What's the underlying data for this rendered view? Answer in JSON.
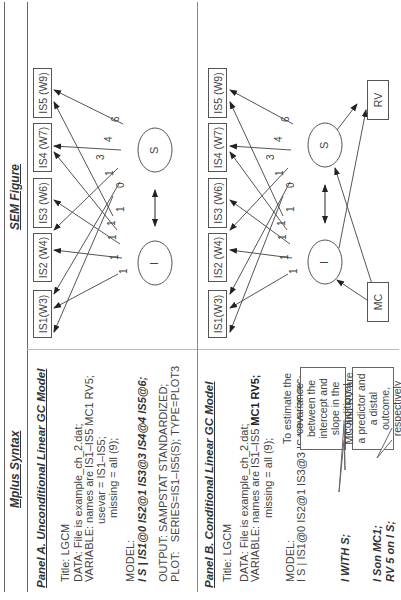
{
  "header": {
    "left_title": "Mplus Syntax",
    "right_title": "SEM Figure"
  },
  "panel_a": {
    "title": "Panel A. Unconditional Linear GC Model",
    "lines": {
      "title": "Title: LGCM",
      "data": "DATA: File is example_ch_2.dat;",
      "variable": "VARIABLE: names are IS1–IS5 MC1 RV5;",
      "usevar": "usevar = IS1–IS5;",
      "missing": "missing = all (9);",
      "model_label": "MODEL:",
      "model": "I S | IS1@0 IS2@1 IS3@3 IS4@4 IS5@6;",
      "output": "OUTPUT: SAMPSTAT STANDARDIZED;",
      "plot": "PLOT:   SERIES=IS1–IS5(S); TYPE=PLOT3"
    },
    "figure": {
      "boxes": [
        "IS1(W3)",
        "IS2 (W4)",
        "IS3 (W6)",
        "IS4 (W7)",
        "IS5 (W9)"
      ],
      "latent": [
        "I",
        "S"
      ],
      "intercept_loadings": [
        "1",
        "1",
        "1",
        "1",
        "1"
      ],
      "slope_loadings": [
        "0",
        "1",
        "3",
        "4",
        "6"
      ]
    }
  },
  "panel_b": {
    "title": "Panel B. Conditional Linear GC Model",
    "lines": {
      "title": "Title: LGCM",
      "data": "DATA: File is example_ch_2.dat;",
      "variable_prefix": "VARIABLE: names are IS1–IS5 ",
      "variable_bold": "MC1 RV5;",
      "missing": "missing = all (9);",
      "model_label": "MODEL:",
      "model": "I S | IS1@0 IS2@1 IS3@3 IS4@4 IS5@6;",
      "with": "I WITH S;",
      "on_1": "I Son MC1;",
      "on_2": "RV 5 on I S;"
    },
    "callouts": {
      "covariance": "To estimate the covariance between the intercept and slope in the conditional LGCM",
      "predictor": "MC and RV are a predictor and a distal outcome, respectively"
    },
    "figure": {
      "boxes": [
        "IS1(W3)",
        "IS2 (W4)",
        "IS3 (W6)",
        "IS4 (W7)",
        "IS5 (W9)"
      ],
      "latent": [
        "I",
        "S"
      ],
      "predictor": "MC",
      "outcome": "RV",
      "intercept_loadings": [
        "1",
        "1",
        "1",
        "1",
        "1"
      ],
      "slope_loadings": [
        "0",
        "1",
        "3",
        "4",
        "6"
      ]
    }
  }
}
